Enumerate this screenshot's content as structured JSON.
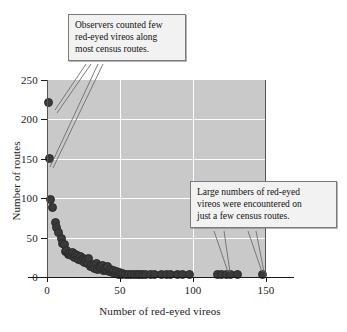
{
  "chart_data": {
    "type": "scatter",
    "title": "",
    "xlabel": "Number of red-eyed vireos",
    "ylabel": "Number of routes",
    "xlim": [
      0,
      150
    ],
    "ylim": [
      0,
      250
    ],
    "xticks": [
      0,
      50,
      100,
      150
    ],
    "yticks": [
      0,
      50,
      100,
      150,
      200,
      250
    ],
    "grid": true,
    "legend": null,
    "points": [
      {
        "x": 0,
        "y": 223
      },
      {
        "x": 1,
        "y": 152
      },
      {
        "x": 2,
        "y": 100
      },
      {
        "x": 3,
        "y": 89
      },
      {
        "x": 5,
        "y": 70
      },
      {
        "x": 6,
        "y": 64
      },
      {
        "x": 7,
        "y": 58
      },
      {
        "x": 9,
        "y": 50
      },
      {
        "x": 10,
        "y": 44
      },
      {
        "x": 11,
        "y": 43
      },
      {
        "x": 12,
        "y": 33
      },
      {
        "x": 13,
        "y": 35
      },
      {
        "x": 14,
        "y": 30
      },
      {
        "x": 15,
        "y": 31
      },
      {
        "x": 16,
        "y": 29
      },
      {
        "x": 17,
        "y": 32
      },
      {
        "x": 18,
        "y": 26
      },
      {
        "x": 19,
        "y": 30
      },
      {
        "x": 20,
        "y": 28
      },
      {
        "x": 21,
        "y": 24
      },
      {
        "x": 22,
        "y": 27
      },
      {
        "x": 23,
        "y": 22
      },
      {
        "x": 24,
        "y": 25
      },
      {
        "x": 25,
        "y": 20
      },
      {
        "x": 26,
        "y": 23
      },
      {
        "x": 27,
        "y": 18
      },
      {
        "x": 28,
        "y": 25
      },
      {
        "x": 29,
        "y": 14
      },
      {
        "x": 30,
        "y": 17
      },
      {
        "x": 31,
        "y": 16
      },
      {
        "x": 32,
        "y": 12
      },
      {
        "x": 33,
        "y": 19
      },
      {
        "x": 34,
        "y": 11
      },
      {
        "x": 35,
        "y": 15
      },
      {
        "x": 36,
        "y": 13
      },
      {
        "x": 37,
        "y": 16
      },
      {
        "x": 38,
        "y": 10
      },
      {
        "x": 39,
        "y": 12
      },
      {
        "x": 40,
        "y": 9
      },
      {
        "x": 41,
        "y": 14
      },
      {
        "x": 42,
        "y": 8
      },
      {
        "x": 43,
        "y": 11
      },
      {
        "x": 44,
        "y": 7
      },
      {
        "x": 45,
        "y": 9
      },
      {
        "x": 46,
        "y": 6
      },
      {
        "x": 47,
        "y": 8
      },
      {
        "x": 48,
        "y": 5
      },
      {
        "x": 49,
        "y": 7
      },
      {
        "x": 50,
        "y": 5
      },
      {
        "x": 51,
        "y": 6
      },
      {
        "x": 53,
        "y": 4
      },
      {
        "x": 55,
        "y": 5
      },
      {
        "x": 57,
        "y": 4
      },
      {
        "x": 59,
        "y": 5
      },
      {
        "x": 61,
        "y": 4
      },
      {
        "x": 63,
        "y": 4
      },
      {
        "x": 65,
        "y": 5
      },
      {
        "x": 67,
        "y": 4
      },
      {
        "x": 70,
        "y": 4
      },
      {
        "x": 73,
        "y": 4
      },
      {
        "x": 78,
        "y": 4
      },
      {
        "x": 81,
        "y": 4
      },
      {
        "x": 84,
        "y": 4
      },
      {
        "x": 89,
        "y": 4
      },
      {
        "x": 92,
        "y": 4
      },
      {
        "x": 97,
        "y": 4
      },
      {
        "x": 116,
        "y": 4
      },
      {
        "x": 119,
        "y": 4
      },
      {
        "x": 122,
        "y": 4
      },
      {
        "x": 125,
        "y": 4
      },
      {
        "x": 130,
        "y": 4
      },
      {
        "x": 147,
        "y": 4
      }
    ],
    "annotations": [
      {
        "id": "low-counts",
        "lines": [
          "Observers counted few",
          "red-eyed vireos along",
          "most census routes."
        ],
        "points_to": [
          {
            "x": 0,
            "y": 223
          },
          {
            "x": 1,
            "y": 152
          }
        ]
      },
      {
        "id": "high-counts",
        "lines": [
          "Large numbers of red-eyed",
          "vireos were encountered on",
          "just a few census routes."
        ],
        "points_to": [
          {
            "x": 120,
            "y": 4
          },
          {
            "x": 147,
            "y": 4
          }
        ]
      }
    ],
    "colors": {
      "plot_background": "#c9c9c9",
      "gridline": "#fdfdfd",
      "point": "#3a3a3a",
      "callout_background": "#f2f2f2",
      "callout_border": "#7a7a7a",
      "axis": "#1a1a1a"
    }
  }
}
